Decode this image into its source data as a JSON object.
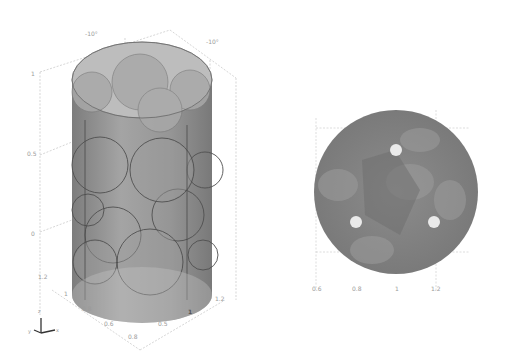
{
  "figure": {
    "left_panel": {
      "name": "3D cylinder packed with spheres",
      "view_labels": [
        "-10°",
        "-10°"
      ],
      "z_ticks": [
        "1",
        "0.5",
        "0"
      ],
      "x_ticks": [
        "1.2",
        "1",
        "0.8",
        "0.6",
        "0.8"
      ],
      "y_ticks": [
        "1",
        "0.5",
        "1.2"
      ],
      "axis_triad": {
        "x": "x",
        "y": "y",
        "z": "z"
      }
    },
    "right_panel": {
      "name": "top view cross-section",
      "x_ticks": [
        "0.6",
        "0.8",
        "1",
        "1.2"
      ]
    },
    "colors": {
      "body": "#7d7d7d",
      "body_light": "#b5b5b5",
      "top": "#c8c8c8",
      "sphere_edge": "#555555",
      "axis": "#bdbdbd",
      "highlight": "#e6e6e6"
    }
  }
}
